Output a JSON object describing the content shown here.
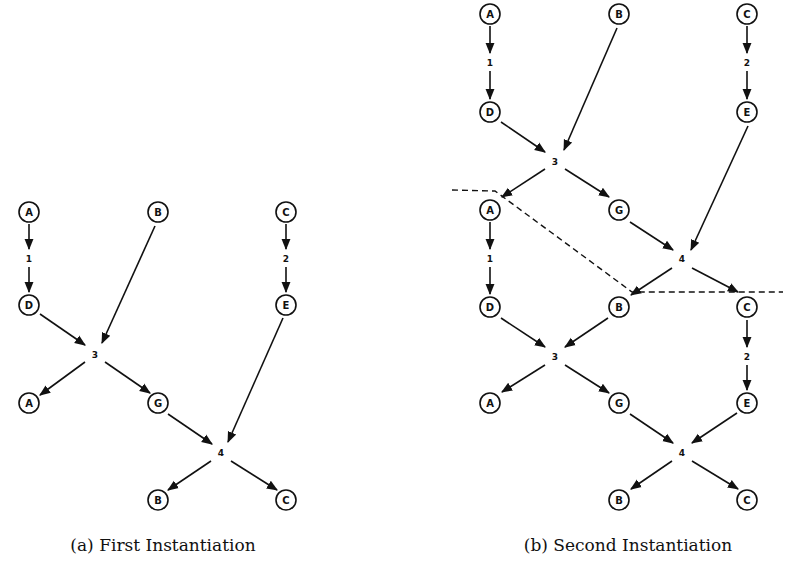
{
  "figure": {
    "panels": [
      {
        "id": "a",
        "caption": "(a) First Instantiation",
        "caption_pos": [
          163,
          535
        ],
        "nodes": [
          {
            "label": "A",
            "x": 29,
            "y": 212
          },
          {
            "label": "B",
            "x": 158,
            "y": 212
          },
          {
            "label": "C",
            "x": 286,
            "y": 212
          },
          {
            "label": "D",
            "x": 29,
            "y": 305
          },
          {
            "label": "E",
            "x": 286,
            "y": 305
          },
          {
            "label": "A",
            "x": 29,
            "y": 403
          },
          {
            "label": "G",
            "x": 158,
            "y": 403
          },
          {
            "label": "B",
            "x": 158,
            "y": 500
          },
          {
            "label": "C",
            "x": 286,
            "y": 500
          }
        ],
        "operators": [
          {
            "label": "1",
            "x": 29,
            "y": 258
          },
          {
            "label": "2",
            "x": 286,
            "y": 258
          },
          {
            "label": "3",
            "x": 95,
            "y": 354
          },
          {
            "label": "4",
            "x": 221,
            "y": 452
          }
        ],
        "edges": [
          [
            29,
            224,
            29,
            249
          ],
          [
            29,
            267,
            29,
            292
          ],
          [
            286,
            224,
            286,
            249
          ],
          [
            286,
            267,
            286,
            292
          ],
          [
            40,
            314,
            85,
            345
          ],
          [
            155,
            226,
            102,
            343
          ],
          [
            85,
            362,
            40,
            395
          ],
          [
            105,
            362,
            150,
            393
          ],
          [
            168,
            414,
            212,
            444
          ],
          [
            283,
            318,
            228,
            442
          ],
          [
            211,
            461,
            168,
            490
          ],
          [
            231,
            461,
            277,
            490
          ]
        ]
      },
      {
        "id": "b",
        "caption": "(b) Second Instantiation",
        "caption_pos": [
          628,
          535
        ],
        "nodes": [
          {
            "label": "A",
            "x": 490,
            "y": 14
          },
          {
            "label": "B",
            "x": 619,
            "y": 14
          },
          {
            "label": "C",
            "x": 747,
            "y": 14
          },
          {
            "label": "D",
            "x": 490,
            "y": 112
          },
          {
            "label": "E",
            "x": 747,
            "y": 112
          },
          {
            "label": "A",
            "x": 490,
            "y": 210
          },
          {
            "label": "G",
            "x": 619,
            "y": 210
          },
          {
            "label": "D",
            "x": 490,
            "y": 307
          },
          {
            "label": "B",
            "x": 619,
            "y": 307
          },
          {
            "label": "C",
            "x": 747,
            "y": 307
          },
          {
            "label": "A",
            "x": 490,
            "y": 403
          },
          {
            "label": "G",
            "x": 619,
            "y": 403
          },
          {
            "label": "E",
            "x": 747,
            "y": 403
          },
          {
            "label": "B",
            "x": 619,
            "y": 500
          },
          {
            "label": "C",
            "x": 747,
            "y": 500
          }
        ],
        "operators": [
          {
            "label": "1",
            "x": 490,
            "y": 62
          },
          {
            "label": "2",
            "x": 747,
            "y": 62
          },
          {
            "label": "3",
            "x": 555,
            "y": 161
          },
          {
            "label": "1",
            "x": 490,
            "y": 258
          },
          {
            "label": "4",
            "x": 682,
            "y": 258
          },
          {
            "label": "3",
            "x": 555,
            "y": 356
          },
          {
            "label": "2",
            "x": 747,
            "y": 356
          },
          {
            "label": "4",
            "x": 682,
            "y": 452
          }
        ],
        "edges": [
          [
            490,
            26,
            490,
            53
          ],
          [
            490,
            71,
            490,
            99
          ],
          [
            747,
            26,
            747,
            53
          ],
          [
            747,
            71,
            747,
            99
          ],
          [
            501,
            122,
            545,
            152
          ],
          [
            617,
            28,
            564,
            150
          ],
          [
            545,
            169,
            502,
            197
          ],
          [
            565,
            169,
            609,
            197
          ],
          [
            490,
            222,
            490,
            249
          ],
          [
            490,
            267,
            490,
            294
          ],
          [
            630,
            222,
            673,
            250
          ],
          [
            748,
            126,
            691,
            250
          ],
          [
            672,
            268,
            631,
            295
          ],
          [
            692,
            268,
            738,
            292
          ],
          [
            501,
            318,
            545,
            347
          ],
          [
            608,
            318,
            565,
            347
          ],
          [
            747,
            320,
            747,
            347
          ],
          [
            747,
            365,
            747,
            390
          ],
          [
            545,
            365,
            502,
            392
          ],
          [
            565,
            365,
            609,
            393
          ],
          [
            630,
            414,
            673,
            443
          ],
          [
            737,
            413,
            692,
            443
          ],
          [
            672,
            461,
            631,
            489
          ],
          [
            692,
            461,
            738,
            489
          ]
        ],
        "cut_line": [
          [
            452,
            190
          ],
          [
            495,
            191
          ],
          [
            632,
            292
          ],
          [
            783,
            292
          ]
        ]
      }
    ]
  }
}
